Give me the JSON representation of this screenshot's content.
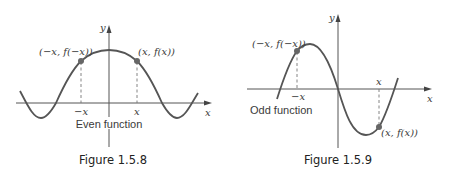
{
  "figures": [
    {
      "caption": "Figure 1.5.8",
      "description": "Even function",
      "axis_labels": {
        "x": "x",
        "y": "y"
      },
      "tick_labels": {
        "neg": "−x",
        "pos": "x"
      },
      "points": [
        {
          "label": "(−x, f(−x))"
        },
        {
          "label": "(x, f(x))"
        }
      ]
    },
    {
      "caption": "Figure 1.5.9",
      "description": "Odd function",
      "axis_labels": {
        "x": "x",
        "y": "y"
      },
      "tick_labels": {
        "neg": "−x",
        "pos": "x"
      },
      "points": [
        {
          "label": "(−x, f(−x))"
        },
        {
          "label": "(x, f(x))"
        }
      ]
    }
  ],
  "colors": {
    "curve": "#555555",
    "point": "#666666",
    "text": "#3a3a3a"
  }
}
